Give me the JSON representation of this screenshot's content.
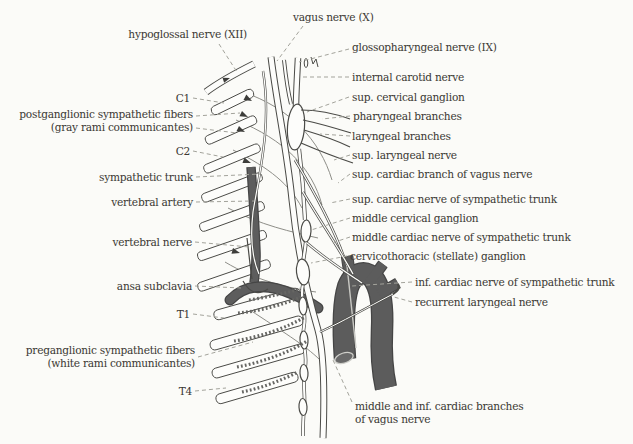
{
  "figure_type": "anatomical line diagram of cervical autonomic and cranial nerves with labeled leader lines",
  "palette": {
    "background": "#fbfbf8",
    "ink": "#4a4a46",
    "text": "#3a3833",
    "leader": "#a3a39b",
    "artery_fill": "#5a5a5a",
    "artery_edge": "#454545"
  },
  "labels": [
    {
      "id": "vagus-nerve",
      "text": "vagus nerve (X)",
      "x": 293,
      "y": 11,
      "align": "left",
      "leaders": [
        [
          303,
          26,
          277,
          61
        ]
      ]
    },
    {
      "id": "hypoglossal-nerve",
      "text": "hypoglossal nerve (XII)",
      "x": 247,
      "y": 28,
      "align": "right",
      "leaders": [
        [
          219,
          44,
          237,
          72
        ]
      ]
    },
    {
      "id": "glossopharyngeal-nerve",
      "text": "glossopharyngeal nerve (IX)",
      "x": 352,
      "y": 41,
      "align": "left",
      "leaders": [
        [
          349,
          49,
          299,
          62
        ]
      ]
    },
    {
      "id": "internal-carotid-nerve",
      "text": "internal carotid nerve",
      "x": 352,
      "y": 71,
      "align": "left",
      "leaders": [
        [
          349,
          77,
          303,
          77
        ]
      ]
    },
    {
      "id": "sup-cervical-ganglion",
      "text": "sup. cervical ganglion",
      "x": 352,
      "y": 91,
      "align": "left",
      "leaders": [
        [
          349,
          97,
          307,
          112
        ]
      ]
    },
    {
      "id": "c1",
      "text": "C1",
      "x": 190,
      "y": 92,
      "align": "right",
      "leaders": [
        [
          193,
          98,
          224,
          103
        ]
      ]
    },
    {
      "id": "postganglionic-fibers",
      "text": "postganglionic sympathetic fibers\n(gray rami communicantes)",
      "x": 193,
      "y": 108,
      "align": "right",
      "leaders": [
        [
          196,
          116,
          240,
          113
        ],
        [
          196,
          128,
          237,
          133
        ]
      ]
    },
    {
      "id": "pharyngeal-branches",
      "text": "pharyngeal branches",
      "x": 353,
      "y": 110,
      "align": "left",
      "leaders": [
        [
          350,
          116,
          322,
          119
        ]
      ]
    },
    {
      "id": "laryngeal-branches",
      "text": "laryngeal branches",
      "x": 352,
      "y": 130,
      "align": "left",
      "leaders": [
        [
          350,
          136,
          320,
          134
        ]
      ]
    },
    {
      "id": "c2",
      "text": "C2",
      "x": 190,
      "y": 145,
      "align": "right",
      "leaders": [
        [
          193,
          151,
          223,
          157
        ]
      ]
    },
    {
      "id": "sup-laryngeal-nerve",
      "text": "sup. laryngeal nerve",
      "x": 352,
      "y": 149,
      "align": "left",
      "leaders": [
        [
          350,
          155,
          334,
          160
        ]
      ]
    },
    {
      "id": "sup-cardiac-branch-vagus",
      "text": "sup. cardiac branch of vagus nerve",
      "x": 352,
      "y": 168,
      "align": "left",
      "leaders": [
        [
          350,
          174,
          338,
          183
        ]
      ]
    },
    {
      "id": "sympathetic-trunk",
      "text": "sympathetic trunk",
      "x": 193,
      "y": 171,
      "align": "right",
      "leaders": [
        [
          196,
          177,
          260,
          174
        ]
      ]
    },
    {
      "id": "sup-cardiac-nerve-symp",
      "text": "sup. cardiac nerve of sympathetic trunk",
      "x": 352,
      "y": 193,
      "align": "left",
      "leaders": [
        [
          350,
          199,
          330,
          203
        ]
      ]
    },
    {
      "id": "vertebral-artery",
      "text": "vertebral artery",
      "x": 193,
      "y": 196,
      "align": "right",
      "leaders": [
        [
          196,
          202,
          254,
          201
        ]
      ]
    },
    {
      "id": "middle-cervical-ganglion",
      "text": "middle cervical ganglion",
      "x": 352,
      "y": 212,
      "align": "left",
      "leaders": [
        [
          350,
          218,
          311,
          230
        ]
      ]
    },
    {
      "id": "middle-cardiac-nerve-symp",
      "text": "middle cardiac nerve of sympathetic trunk",
      "x": 352,
      "y": 231,
      "align": "left",
      "leaders": [
        [
          350,
          237,
          332,
          243
        ]
      ]
    },
    {
      "id": "vertebral-nerve",
      "text": "vertebral nerve",
      "x": 192,
      "y": 236,
      "align": "right",
      "leaders": [
        [
          195,
          242,
          249,
          247
        ]
      ]
    },
    {
      "id": "cervicothoracic-ganglion",
      "text": "cervicothoracic (stellate) ganglion",
      "x": 350,
      "y": 250,
      "align": "left",
      "leaders": [
        [
          347,
          256,
          311,
          263
        ]
      ]
    },
    {
      "id": "inf-cardiac-nerve-symp",
      "text": "inf. cardiac nerve of sympathetic trunk",
      "x": 415,
      "y": 276,
      "align": "left",
      "leaders": [
        [
          412,
          282,
          352,
          286
        ]
      ]
    },
    {
      "id": "ansa-subclavia",
      "text": "ansa subclavia",
      "x": 192,
      "y": 280,
      "align": "right",
      "leaders": [
        [
          195,
          286,
          242,
          288
        ]
      ]
    },
    {
      "id": "recurrent-laryngeal-nerve",
      "text": "recurrent laryngeal nerve",
      "x": 415,
      "y": 296,
      "align": "left",
      "leaders": [
        [
          412,
          302,
          394,
          297
        ]
      ]
    },
    {
      "id": "t1",
      "text": "T1",
      "x": 190,
      "y": 308,
      "align": "right",
      "leaders": [
        [
          193,
          314,
          224,
          318
        ]
      ]
    },
    {
      "id": "preganglionic-fibers",
      "text": "preganglionic sympathetic fibers\n(white rami communicantes)",
      "x": 195,
      "y": 344,
      "align": "right",
      "leaders": [
        [
          198,
          357,
          253,
          342
        ]
      ]
    },
    {
      "id": "t4",
      "text": "T4",
      "x": 192,
      "y": 385,
      "align": "right",
      "leaders": [
        [
          195,
          391,
          226,
          388
        ]
      ]
    },
    {
      "id": "middle-inf-cardiac-branches-vagus",
      "text": "middle and inf. cardiac branches\nof vagus nerve",
      "x": 355,
      "y": 400,
      "align": "left",
      "leaders": [
        [
          352,
          402,
          333,
          360
        ]
      ]
    }
  ]
}
